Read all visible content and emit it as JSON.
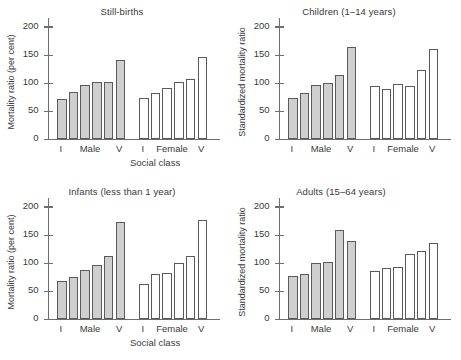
{
  "figure": {
    "xaxis_title": "Social class",
    "ytick_labels": [
      "0",
      "50",
      "100",
      "150",
      "200"
    ],
    "group_labels": {
      "male_first": "I",
      "male": "Male",
      "male_last": "V",
      "female_first": "I",
      "female": "Female",
      "female_last": "V"
    },
    "colors": {
      "male_bar_fill": "#cfcfcf",
      "female_bar_fill": "#ffffff",
      "bar_stroke": "#5a5a5a",
      "axis": "#6e6e6e",
      "text": "#3a3a3a",
      "background": "#ffffff"
    }
  },
  "chart_data": [
    {
      "type": "bar",
      "title": "Still-births",
      "xlabel": "Social class",
      "ylabel": "Mortality ratio (per cent)",
      "ylim": [
        0,
        210
      ],
      "yticks": [
        0,
        50,
        100,
        150,
        200
      ],
      "grid": false,
      "legend": "none",
      "categories": [
        "I",
        "II",
        "IIIN",
        "IIIM",
        "IV",
        "V"
      ],
      "series": [
        {
          "name": "Male",
          "values": [
            72,
            84,
            96,
            101,
            101,
            140
          ]
        },
        {
          "name": "Female",
          "values": [
            73,
            82,
            91,
            102,
            107,
            146
          ]
        }
      ]
    },
    {
      "type": "bar",
      "title": "Children (1–14 years)",
      "xlabel": "Social class",
      "ylabel": "Standardized mortality ratio",
      "ylim": [
        0,
        210
      ],
      "yticks": [
        0,
        50,
        100,
        150,
        200
      ],
      "grid": false,
      "legend": "none",
      "categories": [
        "I",
        "II",
        "IIIN",
        "IIIM",
        "IV",
        "V"
      ],
      "series": [
        {
          "name": "Male",
          "values": [
            73,
            82,
            96,
            100,
            114,
            163
          ]
        },
        {
          "name": "Female",
          "values": [
            94,
            89,
            98,
            94,
            123,
            160
          ]
        }
      ]
    },
    {
      "type": "bar",
      "title": "Infants (less than 1 year)",
      "xlabel": "Social class",
      "ylabel": "Mortality ratio (per cent)",
      "ylim": [
        0,
        210
      ],
      "yticks": [
        0,
        50,
        100,
        150,
        200
      ],
      "grid": false,
      "legend": "none",
      "categories": [
        "I",
        "II",
        "IIIN",
        "IIIM",
        "IV",
        "V"
      ],
      "series": [
        {
          "name": "Male",
          "values": [
            68,
            74,
            87,
            97,
            112,
            173
          ]
        },
        {
          "name": "Female",
          "values": [
            62,
            80,
            82,
            99,
            112,
            176
          ]
        }
      ]
    },
    {
      "type": "bar",
      "title": "Adults (15–64 years)",
      "xlabel": "Social class",
      "ylabel": "Standardized mortality ratio",
      "ylim": [
        0,
        210
      ],
      "yticks": [
        0,
        50,
        100,
        150,
        200
      ],
      "grid": false,
      "legend": "none",
      "categories": [
        "I",
        "II",
        "IIIN",
        "IIIM",
        "IV",
        "V"
      ],
      "series": [
        {
          "name": "Male",
          "values": [
            76,
            80,
            99,
            102,
            159,
            139
          ]
        },
        {
          "name": "Female",
          "values": [
            86,
            91,
            92,
            116,
            121,
            136
          ]
        }
      ]
    }
  ]
}
